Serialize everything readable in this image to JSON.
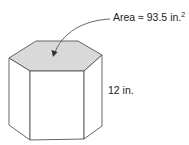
{
  "figure": {
    "area_label": {
      "prefix": "Area ≈ 93.5 in.",
      "exponent": "2"
    },
    "height_label": "12 in.",
    "shape": "hexagonal prism",
    "colors": {
      "top_face": "#d9d9d9",
      "stroke": "#555555",
      "text": "#222222"
    }
  }
}
